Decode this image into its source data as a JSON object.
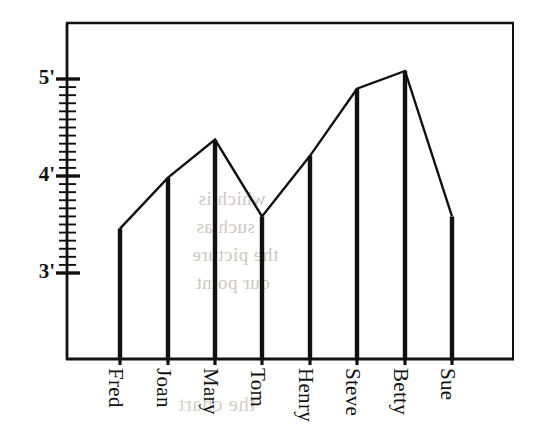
{
  "chart_data": {
    "type": "line",
    "title": "",
    "subtitle": "",
    "xlabel": "",
    "ylabel": "",
    "categories": [
      "Fred",
      "Joan",
      "Mary",
      "Tom",
      "Henry",
      "Steve",
      "Betty",
      "Sue"
    ],
    "values": [
      3.458,
      3.983,
      4.375,
      3.583,
      4.208,
      4.9,
      5.083,
      3.583
    ],
    "value_labels": [
      "3'5\"",
      "3'11\"",
      "4'4\"",
      "3'7\"",
      "4'2\"",
      "4'10\"",
      "5'1\"",
      "3'7\""
    ],
    "ylim": [
      2.55,
      5.72
    ],
    "ytick_values": [
      5,
      4,
      3
    ],
    "ytick_labels": [
      "5'",
      "4'",
      "3'"
    ],
    "minor_ticks_per_major": 12,
    "grid": false,
    "legend": null,
    "series": [
      {
        "name": "height",
        "values": [
          3.458,
          3.983,
          4.375,
          3.583,
          4.208,
          4.9,
          5.083,
          3.583
        ]
      }
    ],
    "style": {
      "line_color": "#111111",
      "bar_color": "#111111",
      "frame_color": "#111111",
      "background": "#ffffff"
    },
    "points": [
      {
        "label": "Fred",
        "x_px": 120,
        "y_px": 228,
        "value": 3.458
      },
      {
        "label": "Joan",
        "x_px": 168,
        "y_px": 178,
        "value": 3.983
      },
      {
        "label": "Mary",
        "x_px": 215,
        "y_px": 139,
        "value": 4.375
      },
      {
        "label": "Tom",
        "x_px": 262,
        "y_px": 216,
        "value": 3.583
      },
      {
        "label": "Henry",
        "x_px": 310,
        "y_px": 155,
        "value": 4.208
      },
      {
        "label": "Steve",
        "x_px": 357,
        "y_px": 103,
        "value": 4.9
      },
      {
        "label": "Betty",
        "x_px": 405,
        "y_px": 71,
        "value": 5.083
      },
      {
        "label": "Sue",
        "x_px": 452,
        "y_px": 216,
        "value": 3.583
      }
    ]
  },
  "axes": {
    "y": {
      "ticks": [
        {
          "label": "5'",
          "y_px": 79
        },
        {
          "label": "4'",
          "y_px": 176
        },
        {
          "label": "3'",
          "y_px": 273
        }
      ]
    },
    "x": {
      "ticks": [
        {
          "label": "Fred",
          "x_px": 120
        },
        {
          "label": "Joan",
          "x_px": 168
        },
        {
          "label": "Mary",
          "x_px": 215
        },
        {
          "label": "Tom",
          "x_px": 262
        },
        {
          "label": "Henry",
          "x_px": 310
        },
        {
          "label": "Steve",
          "x_px": 357
        },
        {
          "label": "Betty",
          "x_px": 405
        },
        {
          "label": "Sue",
          "x_px": 452
        }
      ]
    }
  },
  "background_artifacts": {
    "bleed_line_1": "which is",
    "bleed_line_2": "such as",
    "bleed_line_3": "the picture",
    "bleed_line_4": "our point",
    "bleed_line_5": "the chart",
    "bleed_line_6": ""
  }
}
